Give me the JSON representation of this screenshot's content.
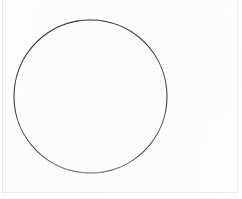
{
  "page": {
    "kind": "scanned-document-figure",
    "width": 242,
    "height": 199,
    "background_color": "#fdfdfd",
    "has_visible_text": false,
    "text_content": ""
  },
  "rules": {
    "left_outer": {
      "name": "page-edge-rule-left-outer",
      "color": "#e6e7e9",
      "x": 2,
      "y_start": 0,
      "y_end": 193,
      "thickness": 1
    },
    "left_inner": {
      "name": "page-edge-rule-left-inner",
      "color": "#f0f1f2",
      "x": 5,
      "y_start": 0,
      "y_end": 193,
      "thickness": 1
    },
    "right": {
      "name": "page-edge-rule-right",
      "color": "#eceded",
      "x": 237,
      "y_start": 0,
      "y_end": 193,
      "thickness": 1
    },
    "bottom": {
      "name": "page-edge-rule-bottom",
      "color": "#e7e8ea",
      "y": 192,
      "x_start": 2,
      "x_end": 238,
      "thickness": 1
    }
  },
  "figure": {
    "name": "circle-outline",
    "shape": "circle",
    "fill": "none",
    "stroke_color": "#3c3c42",
    "stroke_width": 1.1,
    "center_x": 90.5,
    "center_y": 96.5,
    "radius": 76.5,
    "bounding_box": {
      "left": 14,
      "top": 20,
      "right": 167,
      "bottom": 173
    }
  },
  "chart_data": {
    "type": "scatter",
    "title": "",
    "subtitle": "",
    "xlabel": "",
    "ylabel": "",
    "legend": [],
    "annotations": [],
    "grid": false,
    "xlim": [
      0,
      242
    ],
    "ylim": [
      0,
      199
    ],
    "shapes": [
      {
        "type": "circle",
        "cx": 90.5,
        "cy": 96.5,
        "r": 76.5,
        "stroke": "#3c3c42",
        "stroke_width": 1.1,
        "fill": "none"
      }
    ]
  }
}
